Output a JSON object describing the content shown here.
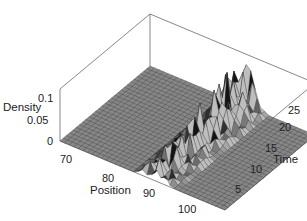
{
  "chart_data": {
    "type": "surface3d",
    "title": "",
    "xlabel": "Position",
    "ylabel": "Time",
    "zlabel": "Density",
    "x_ticks": [
      70,
      80,
      90,
      100
    ],
    "y_ticks": [
      5,
      10,
      15,
      20,
      25
    ],
    "z_ticks": [
      0,
      0.05,
      0.1
    ],
    "xlim": [
      66,
      102
    ],
    "ylim": [
      0,
      28
    ],
    "zlim": [
      0,
      0.1
    ],
    "grid": false,
    "box": true,
    "ridge": {
      "center_position": 87,
      "width": 3,
      "peak_density": 0.1
    }
  },
  "labels": {
    "density": "Density",
    "position": "Position",
    "time": "Time",
    "z0": "0",
    "z005": "0.05",
    "z01": "0.1",
    "x70": "70",
    "x80": "80",
    "x90": "90",
    "x100": "100",
    "y5": "5",
    "y10": "10",
    "y15": "15",
    "y20": "20",
    "y25": "25"
  }
}
